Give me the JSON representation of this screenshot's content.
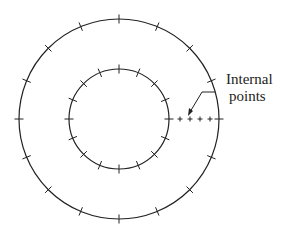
{
  "diagram": {
    "title": "",
    "center": [
      119,
      119
    ],
    "outer_circle": {
      "radius": 100,
      "tick_count": 16
    },
    "inner_circle": {
      "radius": 50,
      "tick_count": 16
    },
    "internal_points": {
      "count": 4,
      "y": 119,
      "x": [
        180,
        190,
        200,
        210
      ]
    },
    "label": {
      "line1": "Internal",
      "line2": "points"
    },
    "stroke_color": "#222222",
    "background": "#ffffff"
  }
}
